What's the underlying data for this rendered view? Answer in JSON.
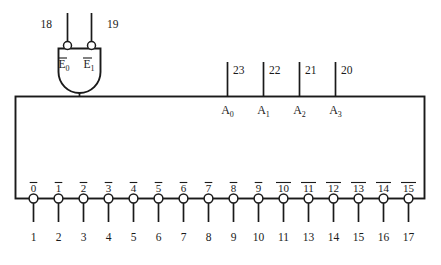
{
  "diagram": {
    "line_color": "#1a1a1a",
    "background_color": "#ffffff",
    "enable_inputs": [
      {
        "label": "E",
        "subscript": "0",
        "overbar": true,
        "pin": "18"
      },
      {
        "label": "E",
        "subscript": "1",
        "overbar": true,
        "pin": "19"
      }
    ],
    "address_inputs": [
      {
        "label": "A",
        "subscript": "0",
        "pin": "23"
      },
      {
        "label": "A",
        "subscript": "1",
        "pin": "22"
      },
      {
        "label": "A",
        "subscript": "2",
        "pin": "21"
      },
      {
        "label": "A",
        "subscript": "3",
        "pin": "20"
      }
    ],
    "outputs": [
      {
        "label": "0",
        "overbar": true,
        "pin": "1"
      },
      {
        "label": "1",
        "overbar": true,
        "pin": "2"
      },
      {
        "label": "2",
        "overbar": true,
        "pin": "3"
      },
      {
        "label": "3",
        "overbar": true,
        "pin": "4"
      },
      {
        "label": "4",
        "overbar": true,
        "pin": "5"
      },
      {
        "label": "5",
        "overbar": true,
        "pin": "6"
      },
      {
        "label": "6",
        "overbar": true,
        "pin": "7"
      },
      {
        "label": "7",
        "overbar": true,
        "pin": "8"
      },
      {
        "label": "8",
        "overbar": true,
        "pin": "9"
      },
      {
        "label": "9",
        "overbar": true,
        "pin": "10"
      },
      {
        "label": "10",
        "overbar": true,
        "pin": "11"
      },
      {
        "label": "11",
        "overbar": true,
        "pin": "13"
      },
      {
        "label": "12",
        "overbar": true,
        "pin": "14"
      },
      {
        "label": "13",
        "overbar": true,
        "pin": "15"
      },
      {
        "label": "14",
        "overbar": true,
        "pin": "16"
      },
      {
        "label": "15",
        "overbar": true,
        "pin": "17"
      }
    ]
  }
}
